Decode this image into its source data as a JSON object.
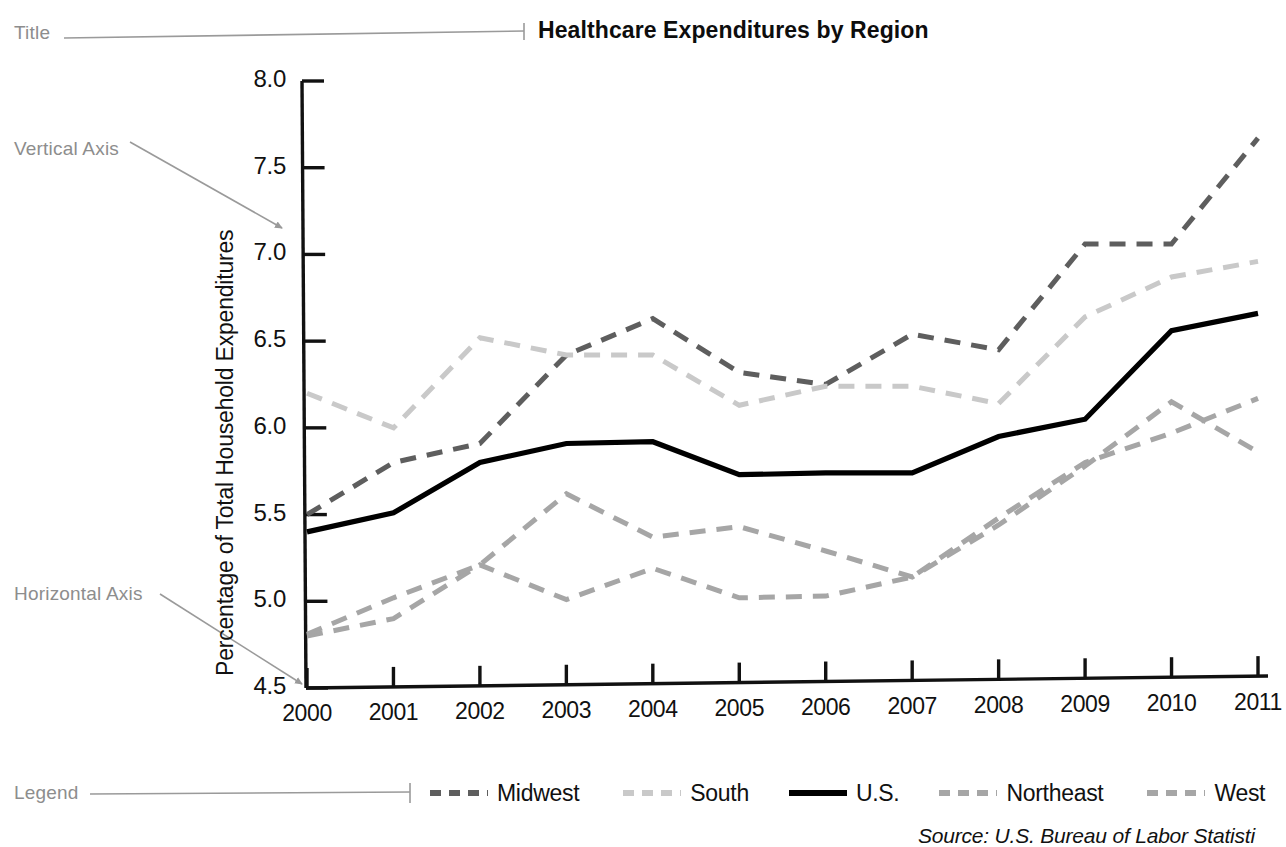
{
  "annotations": {
    "title_callout": "Title",
    "vertical_axis_callout": "Vertical Axis",
    "horizontal_axis_callout": "Horizontal Axis",
    "legend_callout": "Legend"
  },
  "source_note": "Source: U.S. Bureau of Labor Statisti",
  "chart_data": {
    "type": "line",
    "title": "Healthcare Expenditures by Region",
    "xlabel": "",
    "ylabel": "Percentage of Total Household Expenditures",
    "x": [
      "2000",
      "2001",
      "2002",
      "2003",
      "2004",
      "2005",
      "2006",
      "2007",
      "2008",
      "2009",
      "2010",
      "2011"
    ],
    "categories": [
      "2000",
      "2001",
      "2002",
      "2003",
      "2004",
      "2005",
      "2006",
      "2007",
      "2008",
      "2009",
      "2010",
      "2011"
    ],
    "ylim": [
      4.5,
      8.0
    ],
    "yticks": [
      "4.5",
      "5.0",
      "5.5",
      "6.0",
      "6.5",
      "7.0",
      "7.5",
      "8.0"
    ],
    "grid": false,
    "legend_position": "bottom",
    "series": [
      {
        "name": "Midwest",
        "style": "dashed",
        "color": "#5e5e5e",
        "values": [
          5.5,
          5.8,
          5.91,
          6.42,
          6.63,
          6.32,
          6.25,
          6.54,
          6.45,
          7.06,
          7.06,
          7.67
        ]
      },
      {
        "name": "South",
        "style": "dashed",
        "color": "#c9c9c9",
        "values": [
          6.2,
          6.0,
          6.52,
          6.42,
          6.42,
          6.13,
          6.24,
          6.24,
          6.14,
          6.64,
          6.87,
          6.96
        ]
      },
      {
        "name": "U.S.",
        "style": "solid",
        "color": "#000000",
        "values": [
          5.4,
          5.51,
          5.8,
          5.91,
          5.92,
          5.73,
          5.74,
          5.74,
          5.95,
          6.05,
          6.56,
          6.66
        ]
      },
      {
        "name": "Northeast",
        "style": "dashed",
        "color": "#a6a6a6",
        "values": [
          4.8,
          4.9,
          5.21,
          5.01,
          5.19,
          5.02,
          5.03,
          5.14,
          5.48,
          5.8,
          5.97,
          6.17
        ]
      },
      {
        "name": "West",
        "style": "dashed",
        "color": "#a6a6a6",
        "values": [
          4.81,
          5.02,
          5.21,
          5.62,
          5.37,
          5.43,
          5.29,
          5.14,
          5.44,
          5.78,
          6.15,
          5.86
        ]
      }
    ]
  }
}
